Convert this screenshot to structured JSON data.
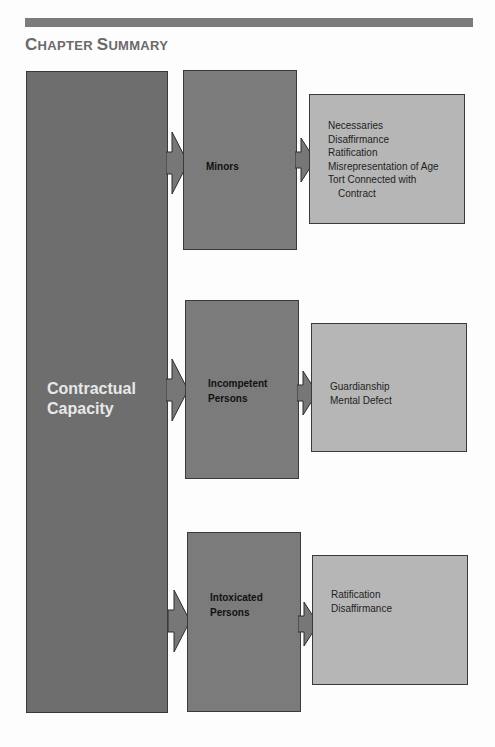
{
  "header": {
    "title_first": "C",
    "title_first_rest": "HAPTER ",
    "title_second": "S",
    "title_second_rest": "UMMARY",
    "title_full": "Chapter Summary"
  },
  "diagram": {
    "root": {
      "line1": "Contractual",
      "line2": "Capacity"
    },
    "branches": [
      {
        "label_line1": "Minors",
        "label_line2": "",
        "items": [
          "Necessaries",
          "Disaffirmance",
          "Ratification",
          "Misrepresentation of Age",
          "Tort Connected with",
          "Contract"
        ]
      },
      {
        "label_line1": "Incompetent",
        "label_line2": "Persons",
        "items": [
          "Guardianship",
          "Mental Defect"
        ]
      },
      {
        "label_line1": "Intoxicated",
        "label_line2": "Persons",
        "items": [
          "Ratification",
          "Disaffirmance"
        ]
      }
    ],
    "colors": {
      "root_fill": "#6e6e6e",
      "branch_fill": "#7b7b7b",
      "detail_fill": "#b6b6b6",
      "arrow_fill": "#777777"
    }
  }
}
